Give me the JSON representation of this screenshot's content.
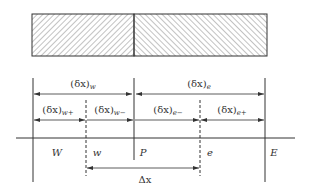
{
  "diagram": {
    "type": "finite-volume-1d-grid",
    "colors": {
      "line": "#333333",
      "hatch": "#666666",
      "background": "#ffffff"
    },
    "bar": {
      "left_region": "hatched-backslash",
      "right_region": "hatched-slash"
    },
    "distances_row1": [
      {
        "base": "(δx)",
        "subscript": "w"
      },
      {
        "base": "(δx)",
        "subscript": "e"
      }
    ],
    "distances_row2": [
      {
        "base": "(δx)",
        "subscript": "w+"
      },
      {
        "base": "(δx)",
        "subscript": "w−"
      },
      {
        "base": "(δx)",
        "subscript": "e−"
      },
      {
        "base": "(δx)",
        "subscript": "e+"
      }
    ],
    "nodes": [
      {
        "label": "W",
        "kind": "grid-point"
      },
      {
        "label": "w",
        "kind": "face"
      },
      {
        "label": "P",
        "kind": "grid-point"
      },
      {
        "label": "e",
        "kind": "face"
      },
      {
        "label": "E",
        "kind": "grid-point"
      }
    ],
    "control_volume": {
      "label": "Δx"
    }
  }
}
